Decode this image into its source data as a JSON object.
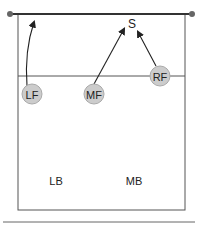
{
  "diagram": {
    "players": [
      {
        "id": "LF",
        "label": "LF",
        "cx": 32,
        "cy": 94,
        "circled": true
      },
      {
        "id": "MF",
        "label": "MF",
        "cx": 94,
        "cy": 94,
        "circled": true
      },
      {
        "id": "RF",
        "label": "RF",
        "cx": 160,
        "cy": 76,
        "circled": true
      },
      {
        "id": "LB",
        "label": "LB",
        "cx": 56,
        "cy": 181,
        "circled": false
      },
      {
        "id": "MB",
        "label": "MB",
        "cx": 134,
        "cy": 181,
        "circled": false
      }
    ],
    "setter_target": {
      "label": "S",
      "x": 132,
      "y": 24
    },
    "colors": {
      "line": "#333333",
      "circle_fill": "#cccccc",
      "circle_stroke": "#aaaaaa",
      "text": "#222222"
    }
  }
}
